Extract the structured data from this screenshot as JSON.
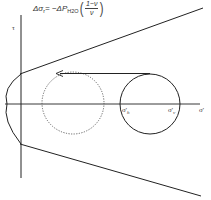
{
  "equation": {
    "lhs": "Δσ",
    "lhs_sub": "r",
    "equals": " = −ΔP",
    "p_sub": "H2O",
    "fraction_numerator": "1−ν",
    "fraction_denominator": "ν"
  },
  "axes": {
    "y_label": "τ",
    "x_label": "σ'",
    "x_label_prime": "'"
  },
  "labels": {
    "sigma_h": {
      "symbol": "σ'",
      "sub": "h"
    },
    "sigma_v": {
      "symbol": "σ'",
      "sub": "v"
    }
  },
  "colors": {
    "line": "#222222",
    "dotted_circle": "#555555",
    "text": "#333333"
  }
}
